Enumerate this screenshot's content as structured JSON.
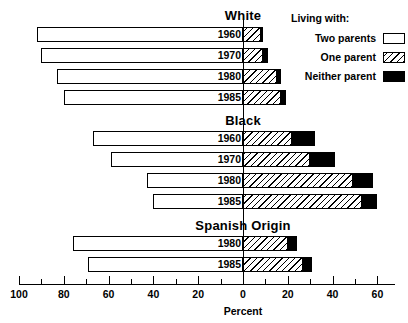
{
  "chart_data": {
    "type": "bar",
    "title": "",
    "xlabel": "Percent",
    "ylabel": "",
    "orientation": "horizontal",
    "stacked": true,
    "grid": false,
    "legend_position": "top-right",
    "xlim": [
      -100,
      68
    ],
    "axis": {
      "tick_labels": [
        "100",
        "80",
        "60",
        "40",
        "20",
        "0",
        "20",
        "40",
        "60"
      ],
      "major_tick_values": [
        -100,
        -80,
        -60,
        -40,
        -20,
        0,
        20,
        40,
        60
      ],
      "minor_tick_values": [
        -90,
        -70,
        -50,
        -30,
        -10,
        10,
        30,
        50
      ],
      "zero_value": 0
    },
    "series": [
      {
        "name": "Two parents",
        "pattern": "open"
      },
      {
        "name": "One parent",
        "pattern": "hatched"
      },
      {
        "name": "Neither parent",
        "pattern": "solid-black"
      }
    ],
    "groups": [
      {
        "name": "White",
        "rows": [
          {
            "category": "1960",
            "two_parents": 92,
            "one_parent": 8,
            "neither_parent": 1
          },
          {
            "category": "1970",
            "two_parents": 90,
            "one_parent": 9,
            "neither_parent": 2
          },
          {
            "category": "1980",
            "two_parents": 83,
            "one_parent": 15,
            "neither_parent": 2
          },
          {
            "category": "1985",
            "two_parents": 80,
            "one_parent": 17,
            "neither_parent": 2
          }
        ]
      },
      {
        "name": "Black",
        "rows": [
          {
            "category": "1960",
            "two_parents": 67,
            "one_parent": 22,
            "neither_parent": 10
          },
          {
            "category": "1970",
            "two_parents": 59,
            "one_parent": 30,
            "neither_parent": 11
          },
          {
            "category": "1980",
            "two_parents": 43,
            "one_parent": 49,
            "neither_parent": 9
          },
          {
            "category": "1985",
            "two_parents": 40,
            "one_parent": 53,
            "neither_parent": 7
          }
        ]
      },
      {
        "name": "Spanish Origin",
        "rows": [
          {
            "category": "1980",
            "two_parents": 76,
            "one_parent": 20,
            "neither_parent": 4
          },
          {
            "category": "1985",
            "two_parents": 69,
            "one_parent": 27,
            "neither_parent": 4
          }
        ]
      }
    ]
  },
  "legend": {
    "title": "Living with:",
    "entries": [
      {
        "label": "Two parents",
        "swatch": "open-swatch"
      },
      {
        "label": "One parent",
        "swatch": "hatched-swatch"
      },
      {
        "label": "Neither parent",
        "swatch": "black-swatch"
      }
    ]
  }
}
